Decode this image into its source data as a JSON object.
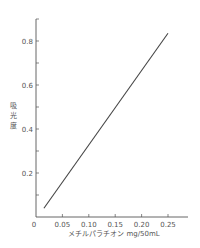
{
  "chart_data": {
    "type": "line",
    "title": "",
    "xlabel": "メチルパラチオン mg/50mL",
    "ylabel": "吸光度",
    "xlim": [
      0,
      0.28
    ],
    "ylim": [
      0,
      0.9
    ],
    "x_ticks": [
      0,
      0.05,
      0.1,
      0.15,
      0.2,
      0.25
    ],
    "x_tick_labels": [
      "0",
      "0.05",
      "0.10",
      "0.15",
      "0.20",
      "0.25"
    ],
    "y_ticks": [
      0.1,
      0.2,
      0.3,
      0.4,
      0.5,
      0.6,
      0.7,
      0.8,
      0.9
    ],
    "y_tick_labels": [
      "0.2",
      "0.4",
      "0.6",
      "0.8"
    ],
    "y_labeled_ticks": [
      0.2,
      0.4,
      0.6,
      0.8
    ],
    "grid": false,
    "legend": null,
    "series": [
      {
        "name": "calibration",
        "x": [
          0.015,
          0.25
        ],
        "y": [
          0.04,
          0.835
        ],
        "color": "#444444"
      }
    ]
  }
}
